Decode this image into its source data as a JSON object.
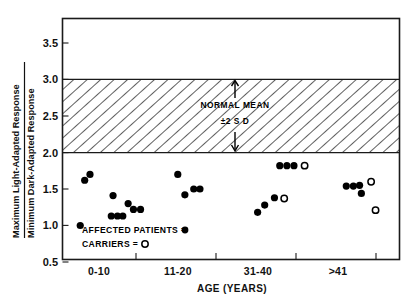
{
  "chart_data": {
    "type": "scatter",
    "title": "",
    "xlabel": "AGE (YEARS)",
    "ylabel_numerator": "Maximum Light-Adapted Response",
    "ylabel_denominator": "Minimum Dark-Adapted Response",
    "categories": [
      "0-10",
      "11-20",
      "31-40",
      ">41"
    ],
    "ylim": [
      0.5,
      3.75
    ],
    "yticks": [
      "0.5",
      "1.0",
      "1.5",
      "2.0",
      "2.5",
      "3.0",
      "3.5"
    ],
    "ytick_values": [
      0.5,
      1.0,
      1.5,
      2.0,
      2.5,
      3.0,
      3.5
    ],
    "grid": false,
    "legend": {
      "position": "inside-lower-left",
      "entries": [
        {
          "label": "AFFECTED PATIENTS =",
          "marker": "filled-circle"
        },
        {
          "label": "CARRIERS =",
          "marker": "open-circle"
        }
      ]
    },
    "annotations": [
      {
        "text": "NORMAL MEAN",
        "x": 34.5,
        "y": 2.72
      },
      {
        "text": "±2 S D",
        "x": 34.5,
        "y": 2.42
      }
    ],
    "bands": [
      {
        "name": "normal-mean-band",
        "label": "NORMAL MEAN ±2 SD",
        "ymin": 2.0,
        "ymax": 3.0,
        "fill": "hatched"
      }
    ],
    "series": [
      {
        "name": "AFFECTED PATIENTS",
        "marker": "filled-circle",
        "color": "#000000",
        "points": [
          {
            "x": 4.0,
            "y": 1.0
          },
          {
            "x": 5.0,
            "y": 1.62
          },
          {
            "x": 6.2,
            "y": 1.7
          },
          {
            "x": 11.0,
            "y": 1.13
          },
          {
            "x": 12.4,
            "y": 1.13
          },
          {
            "x": 13.6,
            "y": 1.13
          },
          {
            "x": 11.4,
            "y": 1.41
          },
          {
            "x": 14.8,
            "y": 1.3
          },
          {
            "x": 16.0,
            "y": 1.22
          },
          {
            "x": 17.6,
            "y": 1.22
          },
          {
            "x": 26.0,
            "y": 1.7
          },
          {
            "x": 27.6,
            "y": 1.42
          },
          {
            "x": 29.6,
            "y": 1.5
          },
          {
            "x": 31.0,
            "y": 1.5
          },
          {
            "x": 44.0,
            "y": 1.18
          },
          {
            "x": 45.6,
            "y": 1.28
          },
          {
            "x": 47.8,
            "y": 1.38
          },
          {
            "x": 49.0,
            "y": 1.82
          },
          {
            "x": 50.6,
            "y": 1.82
          },
          {
            "x": 52.2,
            "y": 1.82
          },
          {
            "x": 64.0,
            "y": 1.54
          },
          {
            "x": 65.6,
            "y": 1.54
          },
          {
            "x": 67.0,
            "y": 1.55
          },
          {
            "x": 67.4,
            "y": 1.44
          }
        ]
      },
      {
        "name": "CARRIERS",
        "marker": "open-circle",
        "color": "#000000",
        "points": [
          {
            "x": 54.6,
            "y": 1.82
          },
          {
            "x": 50.0,
            "y": 1.37
          },
          {
            "x": 69.6,
            "y": 1.6
          },
          {
            "x": 70.6,
            "y": 1.21
          }
        ]
      }
    ]
  },
  "axis": {
    "x_title": "AGE (YEARS)",
    "y_title_top": "Maximum Light-Adapted Response",
    "y_title_bottom": "Minimum Dark-Adapted Response",
    "ytick_0": "0.5",
    "ytick_1": "1.0",
    "ytick_2": "1.5",
    "ytick_3": "2.0",
    "ytick_4": "2.5",
    "ytick_5": "3.0",
    "ytick_6": "3.5",
    "xtick_0": "0-10",
    "xtick_1": "11-20",
    "xtick_2": "31-40",
    "xtick_3": ">41"
  },
  "band_annotation": {
    "line1": "NORMAL MEAN",
    "line2": "±2 S D"
  },
  "legend": {
    "affected_label": "AFFECTED PATIENTS =",
    "carriers_label": "CARRIERS ="
  },
  "colors": {
    "ink": "#111111",
    "marker_filled": "#000000",
    "marker_open_fill": "#ffffff",
    "background": "#ffffff",
    "hatch": "#2a2a2a"
  }
}
